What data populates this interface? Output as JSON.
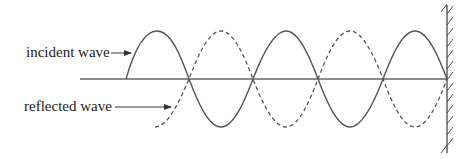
{
  "labels": {
    "incident": "incident wave",
    "reflected": "reflected wave"
  },
  "colors": {
    "line": "#555555",
    "text": "#222222"
  },
  "geometry": {
    "axis_y": 79,
    "amplitude": 48,
    "half_wavelength": 64.5,
    "wall_x": 447
  }
}
